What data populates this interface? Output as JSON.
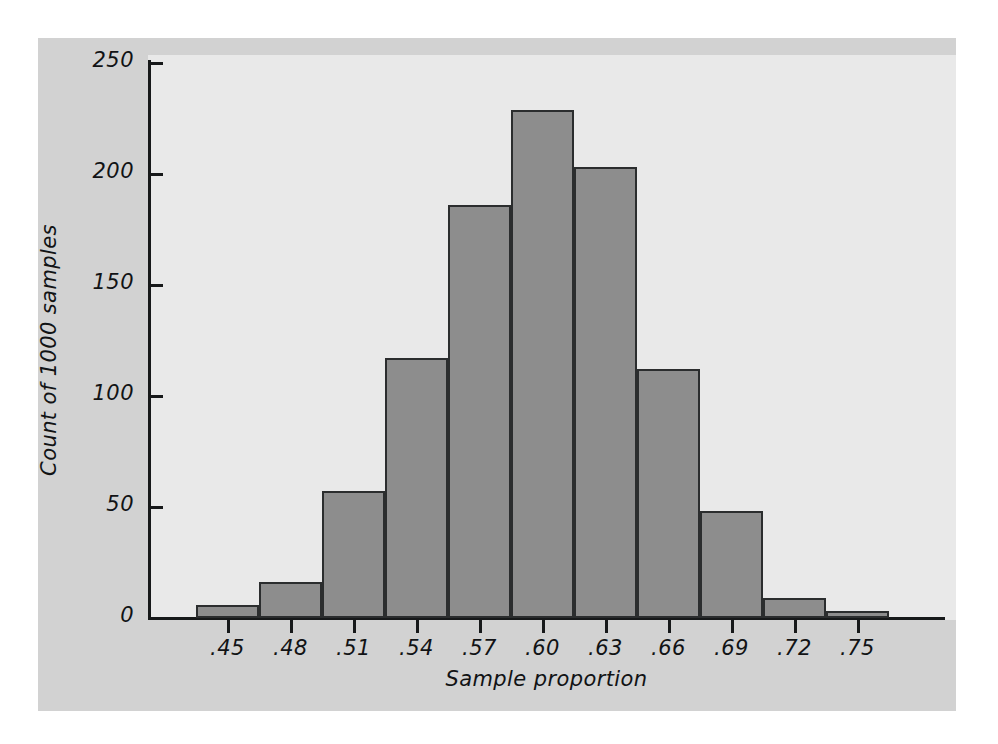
{
  "figure": {
    "background_color": "#ffffff",
    "panel_color": "#d2d2d2",
    "plot_background_color": "#e9e9e9",
    "bar_fill_color": "#8d8d8d",
    "bar_border_color": "#2b2d2e",
    "axis_color": "#17191a"
  },
  "chart_data": {
    "type": "bar",
    "title": "",
    "subtitle": "",
    "xlabel": "Sample proportion",
    "ylabel": "Count of 1000 samples",
    "categories": [
      ".45",
      ".48",
      ".51",
      ".54",
      ".57",
      ".60",
      ".63",
      ".66",
      ".69",
      ".72",
      ".75"
    ],
    "values": [
      6,
      16,
      57,
      117,
      186,
      229,
      203,
      112,
      48,
      9,
      3
    ],
    "x_tick_labels": [
      ".45",
      ".48",
      ".51",
      ".54",
      ".57",
      ".60",
      ".63",
      ".66",
      ".69",
      ".72",
      ".75"
    ],
    "y_tick_labels": [
      "0",
      "50",
      "100",
      "150",
      "200",
      "250"
    ],
    "y_tick_values": [
      0,
      50,
      100,
      150,
      200,
      250
    ],
    "ylim": [
      0,
      250
    ],
    "xlim": [
      0.435,
      0.765
    ],
    "bin_width": 0.03,
    "grid": false,
    "legend": null,
    "annotations": [],
    "n_samples": 1000,
    "bar_count": 11
  }
}
